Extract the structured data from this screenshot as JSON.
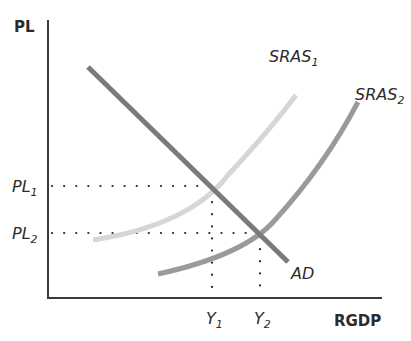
{
  "diagram": {
    "type": "AS-AD model",
    "y_axis_label": "PL",
    "x_axis_label": "RGDP",
    "curves": [
      {
        "name": "AD",
        "label": "AD",
        "sub": "",
        "color": "#7a7a7a",
        "points": [
          [
            88,
            67
          ],
          [
            288,
            262
          ]
        ]
      },
      {
        "name": "SRAS1",
        "label": "SRAS",
        "sub": "1",
        "color": "#d6d6d6"
      },
      {
        "name": "SRAS2",
        "label": "SRAS",
        "sub": "2",
        "color": "#9a9a9a"
      }
    ],
    "price_levels": [
      {
        "label": "PL",
        "sub": "1",
        "y": 186
      },
      {
        "label": "PL",
        "sub": "2",
        "y": 233
      }
    ],
    "outputs": [
      {
        "label": "Y",
        "sub": "1",
        "x": 212
      },
      {
        "label": "Y",
        "sub": "2",
        "x": 260
      }
    ],
    "colors": {
      "axis": "#3a3a3a",
      "ad": "#7a7a7a",
      "sras1": "#d6d6d6",
      "sras2": "#9a9a9a",
      "dots": "#2b2b2b"
    }
  }
}
